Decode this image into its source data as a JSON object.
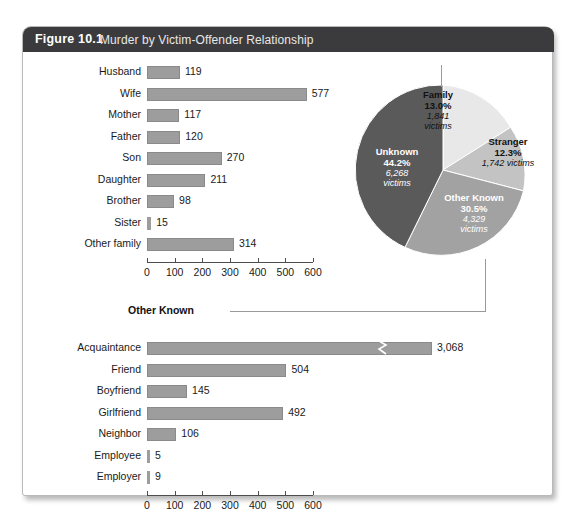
{
  "figure": {
    "number": "Figure 10.1",
    "title": "Murder by Victim-Offender Relationship",
    "header_color": "#3b3b3d",
    "bar_color": "#9d9d9d"
  },
  "chart_data": [
    {
      "type": "bar",
      "orientation": "horizontal",
      "title": "Family",
      "categories": [
        "Husband",
        "Wife",
        "Mother",
        "Father",
        "Son",
        "Daughter",
        "Brother",
        "Sister",
        "Other family"
      ],
      "values": [
        119,
        577,
        117,
        120,
        270,
        211,
        98,
        15,
        314
      ],
      "value_labels": [
        "119",
        "577",
        "117",
        "120",
        "270",
        "211",
        "98",
        "15",
        "314"
      ],
      "xlabel": "",
      "ylabel": "",
      "xlim": [
        0,
        600
      ],
      "xticks": [
        0,
        100,
        200,
        300,
        400,
        500,
        600
      ],
      "xtick_labels": [
        "0",
        "100",
        "200",
        "300",
        "400",
        "500",
        "600"
      ],
      "grid": false,
      "legend": false
    },
    {
      "type": "pie",
      "title": "",
      "slices": [
        {
          "label": "Family",
          "percent": 13.0,
          "percent_label": "13.0%",
          "victims": "1,841",
          "victims_label": "1,841 victims",
          "color": "#e8e8e8"
        },
        {
          "label": "Stranger",
          "percent": 12.3,
          "percent_label": "12.3%",
          "victims": "1,742",
          "victims_label": "1,742 victims",
          "color": "#c3c3c3"
        },
        {
          "label": "Other Known",
          "percent": 30.5,
          "percent_label": "30.5%",
          "victims": "4,329",
          "victims_label": "4,329 victims",
          "color": "#a2a2a2"
        },
        {
          "label": "Unknown",
          "percent": 44.2,
          "percent_label": "44.2%",
          "victims": "6,268",
          "victims_label": "6,268 victims",
          "color": "#5a5a5a"
        }
      ],
      "victims_word": "victims",
      "legend": "inside-slices"
    },
    {
      "type": "bar",
      "orientation": "horizontal",
      "title": "Other Known",
      "categories": [
        "Acquaintance",
        "Friend",
        "Boyfriend",
        "Girlfriend",
        "Neighbor",
        "Employee",
        "Employer"
      ],
      "values": [
        3068,
        504,
        145,
        492,
        106,
        5,
        9
      ],
      "value_labels": [
        "3,068",
        "504",
        "145",
        "492",
        "106",
        "5",
        "9"
      ],
      "axis_break": {
        "series": "Acquaintance",
        "note": "zigzag break, bar truncated"
      },
      "xlabel": "",
      "ylabel": "",
      "xlim": [
        0,
        600
      ],
      "xticks": [
        0,
        100,
        200,
        300,
        400,
        500,
        600
      ],
      "xtick_labels": [
        "0",
        "100",
        "200",
        "300",
        "400",
        "500",
        "600"
      ],
      "grid": false,
      "legend": false
    }
  ]
}
